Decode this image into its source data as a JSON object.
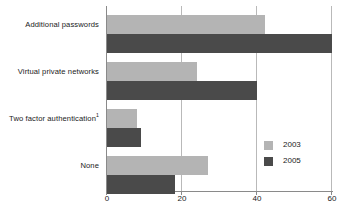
{
  "chart_data": {
    "type": "bar",
    "orientation": "horizontal",
    "title": "",
    "subtitle": "",
    "xlabel": "",
    "ylabel": "",
    "categories": [
      "Additional passwords",
      "Virtual private networks",
      "Two factor authentication",
      "None"
    ],
    "category_footnotes": [
      "",
      "",
      "1",
      ""
    ],
    "series": [
      {
        "name": "2003",
        "color": "#b4b4b4",
        "values": [
          42,
          24,
          8,
          27
        ]
      },
      {
        "name": "2005",
        "color": "#4a4a4a",
        "values": [
          60,
          40,
          9,
          18
        ]
      }
    ],
    "xlim": [
      0,
      60
    ],
    "xticks": [
      0,
      20,
      40,
      60
    ],
    "xtick_labels": [
      "0",
      "20",
      "40",
      "60"
    ],
    "grid": true,
    "grid_axis": "x",
    "legend_position": "inside-right"
  },
  "legend": {
    "entries": [
      {
        "label": "2003",
        "color": "#b4b4b4"
      },
      {
        "label": "2005",
        "color": "#4a4a4a"
      }
    ]
  },
  "colors": {
    "series_2003": "#b4b4b4",
    "series_2005": "#4a4a4a",
    "axis": "#8a8a8a",
    "gridline": "#b9b9b9",
    "background": "#ffffff",
    "text": "#1a1a1a"
  }
}
